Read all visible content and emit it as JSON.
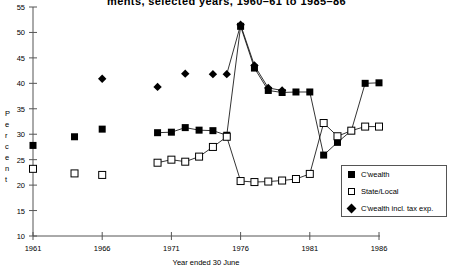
{
  "title": "ments, selected years, 1960–61 to 1985–86",
  "axes": {
    "ylabel_letters": [
      "P",
      "e",
      "r",
      "c",
      "e",
      "n",
      "t"
    ],
    "ylabel": "Per cent",
    "xlabel": "Year ended 30 June",
    "yticks": [
      10,
      15,
      20,
      25,
      30,
      35,
      40,
      45,
      50,
      55
    ],
    "xticks": [
      1961,
      1966,
      1971,
      1976,
      1981,
      1986
    ],
    "ylim": [
      10,
      55
    ],
    "xlim": [
      1961,
      1986
    ]
  },
  "legend": {
    "position": "bottom-right",
    "items": [
      {
        "label": "C'wealth",
        "marker": "filled-square"
      },
      {
        "label": "State/Local",
        "marker": "open-square"
      },
      {
        "label": "C'wealth incl. tax exp.",
        "marker": "filled-diamond"
      }
    ]
  },
  "chart_data": {
    "type": "line",
    "title": "ments, selected years, 1960–61 to 1985–86",
    "xlabel": "Year ended 30 June",
    "ylabel": "Per cent",
    "ylim": [
      10,
      55
    ],
    "xlim": [
      1961,
      1986
    ],
    "grid": false,
    "legend_position": "bottom-right",
    "series": [
      {
        "name": "C'wealth",
        "marker": "filled-square",
        "connected": false,
        "points": [
          {
            "x": 1961,
            "y": 27.8
          },
          {
            "x": 1964,
            "y": 29.5
          },
          {
            "x": 1966,
            "y": 31.0
          }
        ]
      },
      {
        "name": "C'wealth",
        "marker": "filled-square",
        "connected": true,
        "points": [
          {
            "x": 1970,
            "y": 30.3
          },
          {
            "x": 1971,
            "y": 30.4
          },
          {
            "x": 1972,
            "y": 31.3
          },
          {
            "x": 1973,
            "y": 30.8
          },
          {
            "x": 1974,
            "y": 30.7
          },
          {
            "x": 1975,
            "y": 29.8
          },
          {
            "x": 1976,
            "y": 51.2
          },
          {
            "x": 1977,
            "y": 43.0
          },
          {
            "x": 1978,
            "y": 38.6
          },
          {
            "x": 1979,
            "y": 38.2
          },
          {
            "x": 1980,
            "y": 38.3
          },
          {
            "x": 1981,
            "y": 38.3
          },
          {
            "x": 1982,
            "y": 25.9
          },
          {
            "x": 1983,
            "y": 28.4
          },
          {
            "x": 1984,
            "y": 30.7
          },
          {
            "x": 1985,
            "y": 40.0
          },
          {
            "x": 1986,
            "y": 40.1
          }
        ]
      },
      {
        "name": "State/Local",
        "marker": "open-square",
        "connected": false,
        "points": [
          {
            "x": 1961,
            "y": 23.2
          },
          {
            "x": 1964,
            "y": 22.3
          },
          {
            "x": 1966,
            "y": 22.0
          }
        ]
      },
      {
        "name": "State/Local",
        "marker": "open-square",
        "connected": true,
        "points": [
          {
            "x": 1970,
            "y": 24.4
          },
          {
            "x": 1971,
            "y": 25.0
          },
          {
            "x": 1972,
            "y": 24.6
          },
          {
            "x": 1973,
            "y": 25.6
          },
          {
            "x": 1974,
            "y": 27.5
          },
          {
            "x": 1975,
            "y": 29.5
          },
          {
            "x": 1976,
            "y": 20.8
          },
          {
            "x": 1977,
            "y": 20.6
          },
          {
            "x": 1978,
            "y": 20.7
          },
          {
            "x": 1979,
            "y": 20.9
          },
          {
            "x": 1980,
            "y": 21.2
          },
          {
            "x": 1981,
            "y": 22.2
          },
          {
            "x": 1982,
            "y": 32.2
          },
          {
            "x": 1983,
            "y": 29.6
          },
          {
            "x": 1984,
            "y": 30.7
          },
          {
            "x": 1985,
            "y": 31.5
          },
          {
            "x": 1986,
            "y": 31.5
          }
        ]
      },
      {
        "name": "C'wealth incl. tax exp.",
        "marker": "filled-diamond",
        "connected": false,
        "points": [
          {
            "x": 1966,
            "y": 40.9
          },
          {
            "x": 1970,
            "y": 39.3
          },
          {
            "x": 1972,
            "y": 41.9
          },
          {
            "x": 1974,
            "y": 41.8
          }
        ]
      },
      {
        "name": "C'wealth incl. tax exp.",
        "marker": "filled-diamond",
        "connected": true,
        "points": [
          {
            "x": 1975,
            "y": 41.8
          },
          {
            "x": 1976,
            "y": 51.5
          },
          {
            "x": 1977,
            "y": 43.5
          },
          {
            "x": 1978,
            "y": 39.1
          },
          {
            "x": 1979,
            "y": 38.6
          }
        ]
      }
    ]
  },
  "colors": {
    "axis": "#555555",
    "series": "#000000",
    "background": "#ffffff"
  }
}
